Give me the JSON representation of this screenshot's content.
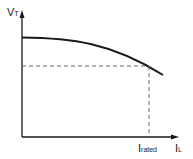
{
  "diagram": {
    "y_axis": {
      "label": "V",
      "subscript": "T"
    },
    "x_axis": {
      "label": "I",
      "subscript": "L"
    },
    "marker": {
      "label": "I",
      "subscript": "rated"
    },
    "colors": {
      "line": "#1a1a1a",
      "dashed": "#555555",
      "background": "#ffffff"
    }
  }
}
